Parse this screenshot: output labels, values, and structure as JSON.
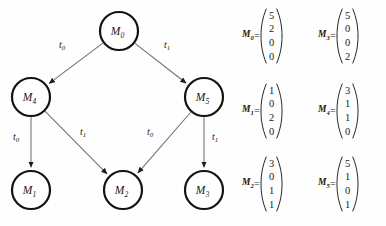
{
  "figure": {
    "background_color": "#fefefe",
    "node_stroke_color": "#131313",
    "edge_color": "#6f6f6f",
    "text_color": "#1a1a1a"
  },
  "graph": {
    "nodes": [
      {
        "id": "M0",
        "label": "M",
        "sub": "0",
        "cx": 119,
        "cy": 31,
        "r": 19
      },
      {
        "id": "M4",
        "label": "M",
        "sub": "4",
        "cx": 31,
        "cy": 97,
        "r": 19
      },
      {
        "id": "M5",
        "label": "M",
        "sub": "5",
        "cx": 204,
        "cy": 97,
        "r": 19
      },
      {
        "id": "M1",
        "label": "M",
        "sub": "1",
        "cx": 31,
        "cy": 190,
        "r": 19
      },
      {
        "id": "M2",
        "label": "M",
        "sub": "2",
        "cx": 123,
        "cy": 190,
        "r": 19
      },
      {
        "id": "M3",
        "label": "M",
        "sub": "3",
        "cx": 204,
        "cy": 190,
        "r": 19
      }
    ],
    "edges": [
      {
        "from": "M0",
        "to": "M4",
        "label": "t",
        "sub": "0",
        "lx": 62,
        "ly": 48
      },
      {
        "from": "M0",
        "to": "M5",
        "label": "t",
        "sub": "1",
        "lx": 167,
        "ly": 48
      },
      {
        "from": "M4",
        "to": "M1",
        "label": "t",
        "sub": "0",
        "lx": 16,
        "ly": 140
      },
      {
        "from": "M4",
        "to": "M2",
        "label": "t",
        "sub": "1",
        "lx": 83,
        "ly": 135
      },
      {
        "from": "M5",
        "to": "M2",
        "label": "t",
        "sub": "0",
        "lx": 150,
        "ly": 135
      },
      {
        "from": "M5",
        "to": "M3",
        "label": "t",
        "sub": "1",
        "lx": 215,
        "ly": 140
      }
    ]
  },
  "matrices": [
    {
      "name": "M",
      "sub": "0",
      "values": [
        "5",
        "2",
        "0",
        "0"
      ],
      "left": 4,
      "top": 8
    },
    {
      "name": "M",
      "sub": "3",
      "values": [
        "5",
        "0",
        "0",
        "2"
      ],
      "left": 80,
      "top": 8
    },
    {
      "name": "M",
      "sub": "1",
      "values": [
        "1",
        "0",
        "2",
        "0"
      ],
      "left": 4,
      "top": 83
    },
    {
      "name": "M",
      "sub": "4",
      "values": [
        "3",
        "1",
        "1",
        "0"
      ],
      "left": 80,
      "top": 83
    },
    {
      "name": "M",
      "sub": "2",
      "values": [
        "3",
        "0",
        "1",
        "1"
      ],
      "left": 4,
      "top": 156
    },
    {
      "name": "M",
      "sub": "5",
      "values": [
        "5",
        "1",
        "0",
        "1"
      ],
      "left": 80,
      "top": 156
    }
  ],
  "symbols": {
    "equals": "="
  }
}
